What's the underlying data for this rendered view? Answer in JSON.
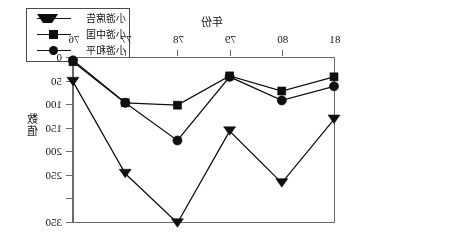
{
  "figure": {
    "mirrored": true,
    "note_rendering": "scanned figure is horizontally flipped"
  },
  "legend": {
    "items": [
      {
        "label": "小游席告",
        "marker": "triangle-marker",
        "marker_name": "legend-marker-triangle"
      },
      {
        "label": "小游中国",
        "marker": "square-marker",
        "marker_name": "legend-marker-square"
      },
      {
        "label": "小游和平",
        "marker": "circle-marker",
        "marker_name": "legend-marker-circle"
      }
    ]
  },
  "axes": {
    "x_title": "年份",
    "y_title_chars": [
      "数",
      "值"
    ],
    "x_ticks": [
      "81",
      "80",
      "79",
      "78",
      "77",
      "76"
    ],
    "y_ticks": [
      "0",
      "50",
      "100",
      "150",
      "200",
      "250",
      "300",
      "350"
    ]
  },
  "chart_data": {
    "type": "line",
    "title": "",
    "subtitle": "",
    "xlabel": "年份",
    "ylabel": "数值",
    "x": [
      "81",
      "80",
      "79",
      "78",
      "77",
      "76"
    ],
    "categories": [
      "81",
      "80",
      "79",
      "78",
      "77",
      "76"
    ],
    "series": [
      {
        "name": "小游席告",
        "marker": "triangle",
        "values": [
          130,
          265,
          155,
          350,
          245,
          50
        ]
      },
      {
        "name": "小游中国",
        "marker": "square",
        "values": [
          40,
          70,
          38,
          100,
          95,
          8
        ]
      },
      {
        "name": "小游和平",
        "marker": "circle",
        "values": [
          60,
          90,
          40,
          175,
          95,
          5
        ]
      }
    ],
    "ylim": [
      0,
      350
    ],
    "y_inverted": true,
    "y_ticks": [
      0,
      50,
      100,
      150,
      200,
      250,
      300,
      350
    ],
    "grid": false,
    "x_axis_position": "top",
    "y_axis_position": "right",
    "legend_position": "top-left-outside"
  }
}
